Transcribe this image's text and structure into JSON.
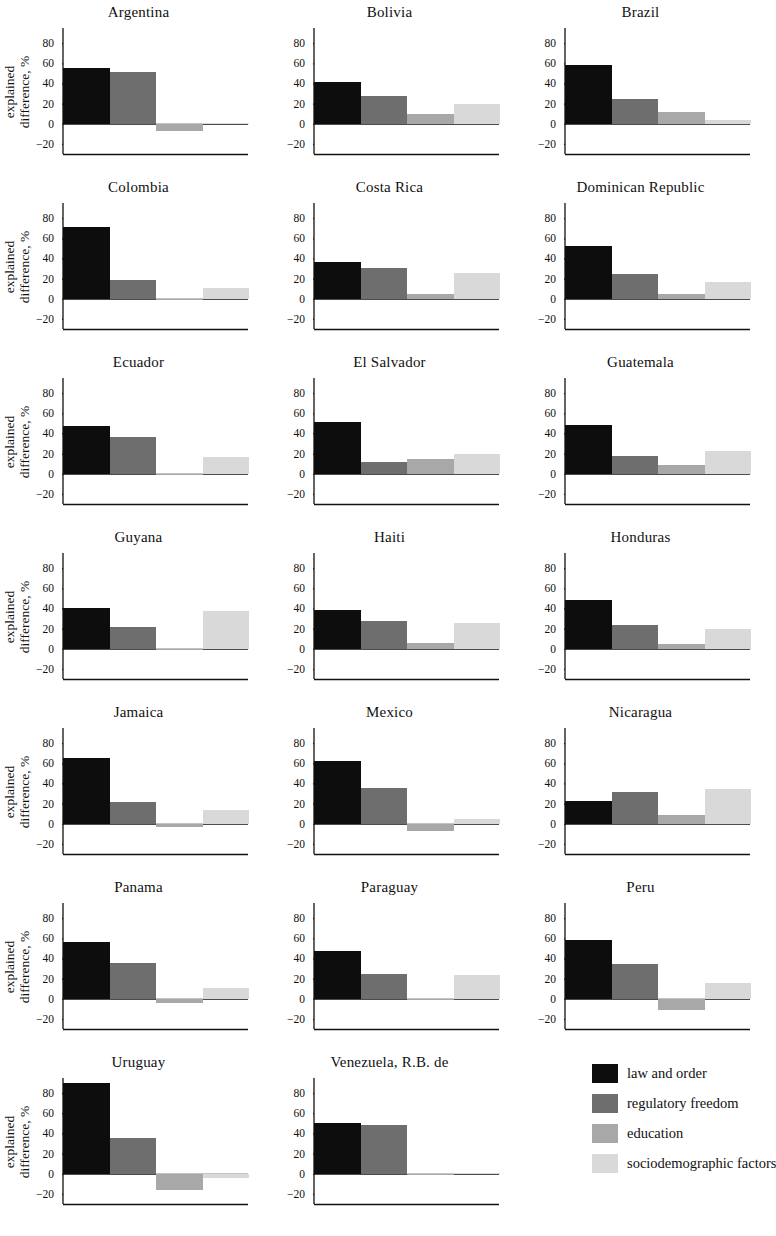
{
  "figure": {
    "ylabel_line1": "explained",
    "ylabel_line2": "difference, %"
  },
  "legend": {
    "items": [
      {
        "label": "law and order",
        "color": "#0d0d0d",
        "key": "law_and_order"
      },
      {
        "label": "regulatory freedom",
        "color": "#6e6e6e",
        "key": "regulatory_freedom"
      },
      {
        "label": "education",
        "color": "#a8a8a8",
        "key": "education"
      },
      {
        "label": "sociodemographic factors",
        "color": "#d9d9d9",
        "key": "sociodemographic_factors"
      }
    ]
  },
  "chart_data": {
    "type": "bar",
    "title": "",
    "xlabel": "",
    "ylabel": "explained difference, %",
    "ylim": [
      -30,
      95
    ],
    "yticks": [
      -20,
      0,
      20,
      40,
      60,
      80
    ],
    "ytick_labels": [
      "−20",
      "0",
      "20",
      "40",
      "60",
      "80"
    ],
    "grid": false,
    "legend_position": "bottom-right",
    "series_names": [
      "law and order",
      "regulatory freedom",
      "education",
      "sociodemographic factors"
    ],
    "series_colors": [
      "#0d0d0d",
      "#6e6e6e",
      "#a8a8a8",
      "#d9d9d9"
    ],
    "panels": [
      {
        "title": "Argentina",
        "values": [
          55,
          51,
          -7,
          1
        ]
      },
      {
        "title": "Bolivia",
        "values": [
          41,
          28,
          10,
          20
        ]
      },
      {
        "title": "Brazil",
        "values": [
          58,
          25,
          12,
          4
        ]
      },
      {
        "title": "Colombia",
        "values": [
          71,
          19,
          0,
          11
        ]
      },
      {
        "title": "Costa Rica",
        "values": [
          36,
          31,
          5,
          26
        ]
      },
      {
        "title": "Dominican Republic",
        "values": [
          52,
          25,
          5,
          17
        ]
      },
      {
        "title": "Ecuador",
        "values": [
          47,
          36,
          0,
          17
        ]
      },
      {
        "title": "El Salvador",
        "values": [
          51,
          12,
          15,
          20
        ]
      },
      {
        "title": "Guatemala",
        "values": [
          48,
          18,
          9,
          23
        ]
      },
      {
        "title": "Guyana",
        "values": [
          40,
          22,
          0,
          37
        ]
      },
      {
        "title": "Haiti",
        "values": [
          38,
          28,
          6,
          26
        ]
      },
      {
        "title": "Honduras",
        "values": [
          48,
          24,
          5,
          20
        ]
      },
      {
        "title": "Jamaica",
        "values": [
          65,
          22,
          -3,
          14
        ]
      },
      {
        "title": "Mexico",
        "values": [
          62,
          35,
          -7,
          5
        ]
      },
      {
        "title": "Nicaragua",
        "values": [
          23,
          32,
          9,
          34
        ]
      },
      {
        "title": "Panama",
        "values": [
          56,
          35,
          -4,
          11
        ]
      },
      {
        "title": "Paraguay",
        "values": [
          47,
          25,
          0,
          24
        ]
      },
      {
        "title": "Peru",
        "values": [
          58,
          34,
          -11,
          16
        ]
      },
      {
        "title": "Uruguay",
        "values": [
          90,
          35,
          -16,
          -4
        ]
      },
      {
        "title": "Venezuela, R.B. de",
        "values": [
          50,
          48,
          0,
          1
        ]
      }
    ]
  }
}
